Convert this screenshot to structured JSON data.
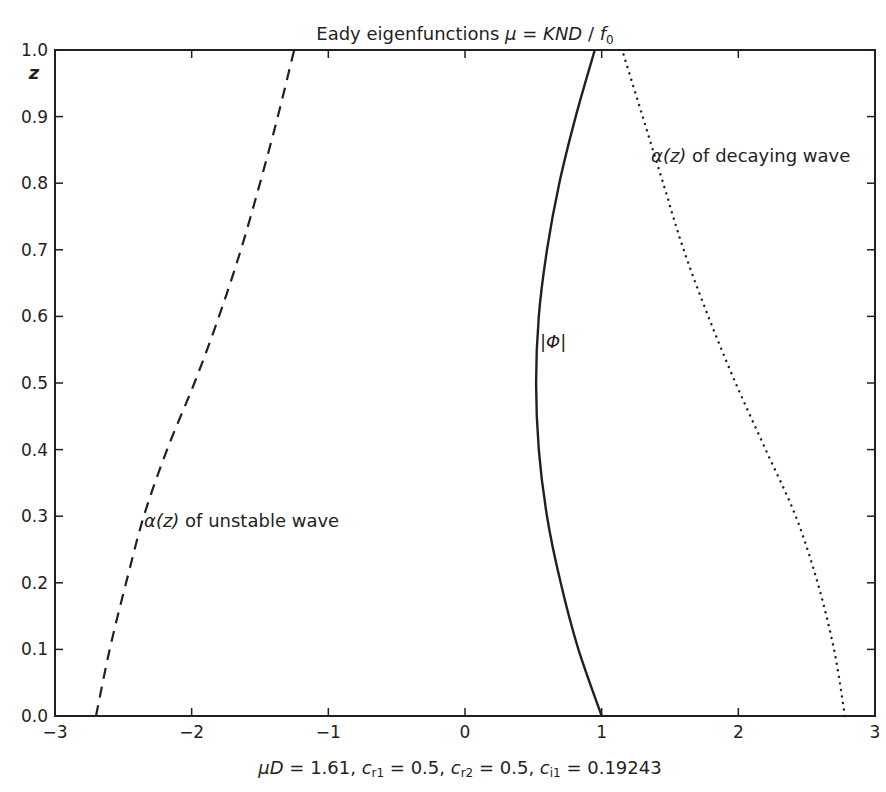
{
  "chart_data": {
    "type": "line",
    "title_parts": {
      "text": "Eady eigenfunctions ",
      "mu": "μ",
      "eq": " = ",
      "expr": "KND",
      "slash": " / ",
      "f": "f",
      "sub": "0"
    },
    "xlabel": "μD = 1.61,  cr1 = 0.5,  cr2 = 0.5,  ci1 = 0.19243",
    "xlabel_parts": {
      "muD": "μD",
      "muD_val": " = 1.61,  ",
      "cr1": "c",
      "cr1_sub": "r1",
      "cr1_val": " = 0.5,  ",
      "cr2": "c",
      "cr2_sub": "r2",
      "cr2_val": " = 0.5,  ",
      "ci1": "c",
      "ci1_sub": "i1",
      "ci1_val": " = 0.19243"
    },
    "ylabel": "z",
    "xlim": [
      -3,
      3
    ],
    "ylim": [
      0,
      1
    ],
    "xticks": [
      "−3",
      "−2",
      "−1",
      "0",
      "1",
      "2",
      "3"
    ],
    "xtick_values": [
      -3,
      -2,
      -1,
      0,
      1,
      2,
      3
    ],
    "yticks": [
      "0.0",
      "0.1",
      "0.2",
      "0.3",
      "0.4",
      "0.5",
      "0.6",
      "0.7",
      "0.8",
      "0.9",
      "1.0"
    ],
    "ytick_values": [
      0,
      0.1,
      0.2,
      0.3,
      0.4,
      0.5,
      0.6,
      0.7,
      0.8,
      0.9,
      1.0
    ],
    "grid": false,
    "legend": "none (inline annotations)",
    "series": [
      {
        "name": "α(z) of unstable wave",
        "style": "dashed",
        "z": [
          0,
          0.1,
          0.2,
          0.3,
          0.4,
          0.5,
          0.6,
          0.7,
          0.8,
          0.9,
          1.0
        ],
        "x": [
          -2.7,
          -2.6,
          -2.48,
          -2.35,
          -2.18,
          -1.98,
          -1.8,
          -1.64,
          -1.5,
          -1.37,
          -1.25
        ]
      },
      {
        "name": "|Φ|",
        "style": "solid",
        "z": [
          0,
          0.1,
          0.2,
          0.3,
          0.4,
          0.5,
          0.6,
          0.7,
          0.8,
          0.9,
          1.0
        ],
        "x": [
          1.0,
          0.83,
          0.7,
          0.6,
          0.54,
          0.52,
          0.54,
          0.6,
          0.69,
          0.81,
          0.95
        ]
      },
      {
        "name": "α(z) of decaying wave",
        "style": "dotted",
        "z": [
          0,
          0.1,
          0.2,
          0.3,
          0.4,
          0.5,
          0.6,
          0.7,
          0.8,
          0.9,
          1.0
        ],
        "x": [
          2.78,
          2.7,
          2.58,
          2.42,
          2.2,
          1.98,
          1.78,
          1.6,
          1.45,
          1.3,
          1.15
        ]
      }
    ],
    "annotations": [
      {
        "text": "α(z) of unstable wave",
        "x": -2.25,
        "z": 0.3
      },
      {
        "text": "|Φ|",
        "x": 0.52,
        "z": 0.56
      },
      {
        "text": "α(z) of decaying wave",
        "x": 1.35,
        "z": 0.84
      }
    ]
  },
  "labels": {
    "y_axis": "z",
    "annot_unstable_alpha": "α",
    "annot_unstable_z": "(z)",
    "annot_unstable_rest": " of unstable wave",
    "annot_decaying_alpha": "α",
    "annot_decaying_z": "(z)",
    "annot_decaying_rest": " of decaying wave",
    "annot_phi": "|Φ|"
  }
}
